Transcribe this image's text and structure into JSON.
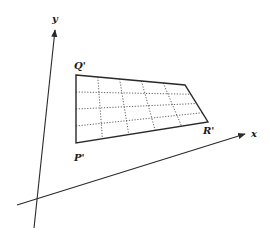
{
  "figure": {
    "type": "transformed-grid-diagram",
    "axes": {
      "x_label": "x",
      "y_label": "y"
    },
    "vertices": {
      "Q": {
        "label": "Q'",
        "x": 76,
        "y": 75
      },
      "T": {
        "label": "",
        "x": 185,
        "y": 85
      },
      "R": {
        "label": "R'",
        "x": 208,
        "y": 122
      },
      "P": {
        "label": "P'",
        "x": 76,
        "y": 143
      }
    },
    "grid": {
      "columns": 5,
      "rows": 4,
      "line_style": "dotted"
    },
    "colors": {
      "stroke": "#2a2a2a",
      "background": "#ffffff"
    }
  }
}
